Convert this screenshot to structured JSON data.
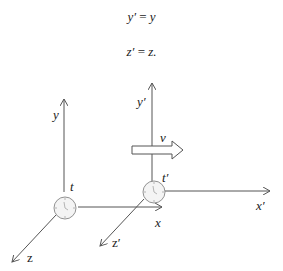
{
  "equations": [
    {
      "lhs": "y′",
      "op": "=",
      "rhs": "y"
    },
    {
      "lhs": "z′",
      "op": "=",
      "rhs": "z."
    }
  ],
  "diagram": {
    "frame_s": {
      "axes": {
        "x": "x",
        "y": "y",
        "z": "z"
      },
      "clock_label": "t"
    },
    "frame_s_prime": {
      "axes": {
        "x": "x′",
        "y": "y′",
        "z": "z′"
      },
      "clock_label": "t′"
    },
    "velocity_label": "v",
    "colors": {
      "line": "#555555",
      "text": "#1a1a1a",
      "clock_fill": "#f4f4f4"
    }
  }
}
